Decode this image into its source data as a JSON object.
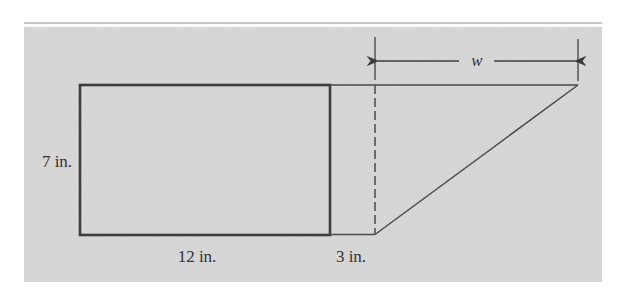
{
  "figure": {
    "colors": {
      "panel": "#d3d3d3",
      "panel_top_rule": "#c8c8c8",
      "stroke": "#3c3c3c",
      "thin_stroke": "#4a4a4a",
      "text": "#333333"
    },
    "labels": {
      "height": "7 in.",
      "rect_width": "12 in.",
      "gap_width": "3 in.",
      "triangle_width": "w"
    },
    "shapes": {
      "rectangle": {
        "dims": "12 in. × 7 in."
      },
      "gap_segment": {
        "length": "3 in."
      },
      "right_triangle": {
        "base_label": "w",
        "height": "7 in."
      },
      "dimension_arrow": {
        "label": "w",
        "direction": "double-headed horizontal"
      }
    }
  }
}
